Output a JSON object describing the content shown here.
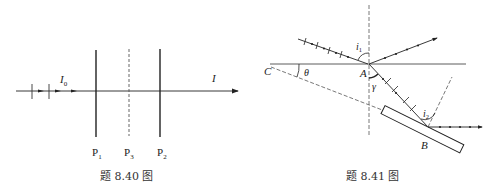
{
  "figure_840": {
    "caption": "题 8.40 图",
    "incident_label": "I",
    "incident_sub": "0",
    "output_label": "I",
    "polarizers": [
      {
        "label": "P",
        "sub": "1",
        "style": "solid"
      },
      {
        "label": "P",
        "sub": "3",
        "style": "dashed"
      },
      {
        "label": "P",
        "sub": "2",
        "style": "solid"
      }
    ]
  },
  "figure_841": {
    "caption": "题 8.41 图",
    "points": {
      "A": "A",
      "B": "B",
      "C": "C"
    },
    "angles": {
      "i1": "i",
      "i1_sub": "1",
      "i2": "i",
      "i2_sub": "2",
      "theta": "θ",
      "gamma": "γ"
    }
  },
  "colors": {
    "line": "#222222",
    "dash": "#555555",
    "background": "#ffffff"
  }
}
